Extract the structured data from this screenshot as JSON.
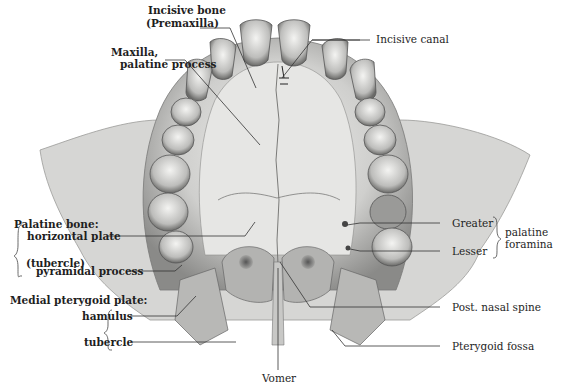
{
  "figure": {
    "palette": {
      "bone_light": "#e8e8e6",
      "bone_mid": "#b9b9b7",
      "bone_dark": "#6e6e6c",
      "line": "#2a2a2a",
      "background": "#ffffff"
    }
  },
  "labels": {
    "incisive_bone": {
      "line1": "Incisive bone",
      "line2": "(Premaxilla)"
    },
    "maxilla": {
      "line1": "Maxilla,",
      "line2": "palatine process"
    },
    "incisive_canal": "Incisive canal",
    "palatine_bone": {
      "title": "Palatine bone:",
      "horizontal_plate": "horizontal plate",
      "tubercle": "(tubercle)",
      "pyramidal_process": "pyramidal process"
    },
    "medial_pterygoid_plate": {
      "title": "Medial pterygoid plate:",
      "hamulus": "hamulus",
      "tubercle": "tubercle"
    },
    "palatine_foramina": {
      "greater": "Greater",
      "lesser": "Lesser",
      "group_line1": "palatine",
      "group_line2": "foramina"
    },
    "post_nasal_spine": "Post. nasal spine",
    "pterygoid_fossa": "Pterygoid fossa",
    "vomer": "Vomer"
  }
}
